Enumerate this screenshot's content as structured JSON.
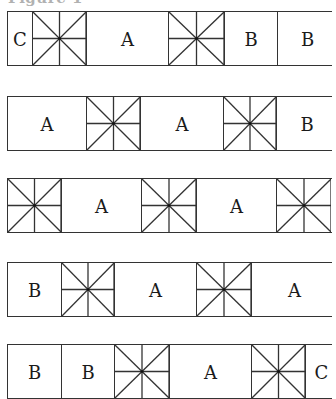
{
  "figure": {
    "title": "Figure 1",
    "rows": [
      {
        "top": 11,
        "cells": [
          {
            "type": "letter",
            "label": "C",
            "x": 0,
            "w": 25
          },
          {
            "type": "star",
            "label": "",
            "x": 25,
            "w": 54
          },
          {
            "type": "letter",
            "label": "A",
            "x": 79,
            "w": 82
          },
          {
            "type": "star",
            "label": "",
            "x": 161,
            "w": 56
          },
          {
            "type": "letter",
            "label": "B",
            "x": 217,
            "w": 53
          },
          {
            "type": "letter",
            "label": "B",
            "x": 270,
            "w": 60
          }
        ]
      },
      {
        "top": 96,
        "cells": [
          {
            "type": "letter",
            "label": "A",
            "x": 0,
            "w": 79
          },
          {
            "type": "star",
            "label": "",
            "x": 79,
            "w": 54
          },
          {
            "type": "letter",
            "label": "A",
            "x": 133,
            "w": 83
          },
          {
            "type": "star",
            "label": "",
            "x": 216,
            "w": 53
          },
          {
            "type": "letter",
            "label": "B",
            "x": 269,
            "w": 61
          }
        ]
      },
      {
        "top": 178,
        "cells": [
          {
            "type": "star",
            "label": "",
            "x": 0,
            "w": 54
          },
          {
            "type": "letter",
            "label": "A",
            "x": 54,
            "w": 80
          },
          {
            "type": "star",
            "label": "",
            "x": 134,
            "w": 55
          },
          {
            "type": "letter",
            "label": "A",
            "x": 189,
            "w": 80
          },
          {
            "type": "star",
            "label": "",
            "x": 269,
            "w": 55
          }
        ]
      },
      {
        "top": 262,
        "cells": [
          {
            "type": "letter",
            "label": "B",
            "x": 0,
            "w": 54
          },
          {
            "type": "star",
            "label": "",
            "x": 54,
            "w": 53
          },
          {
            "type": "letter",
            "label": "A",
            "x": 107,
            "w": 82
          },
          {
            "type": "star",
            "label": "",
            "x": 189,
            "w": 55
          },
          {
            "type": "letter",
            "label": "A",
            "x": 244,
            "w": 86
          }
        ]
      },
      {
        "top": 344,
        "cells": [
          {
            "type": "letter",
            "label": "B",
            "x": 0,
            "w": 54
          },
          {
            "type": "letter",
            "label": "B",
            "x": 54,
            "w": 53
          },
          {
            "type": "star",
            "label": "",
            "x": 107,
            "w": 55
          },
          {
            "type": "letter",
            "label": "A",
            "x": 162,
            "w": 82
          },
          {
            "type": "star",
            "label": "",
            "x": 244,
            "w": 54
          },
          {
            "type": "letter",
            "label": "C",
            "x": 298,
            "w": 32
          }
        ]
      }
    ]
  }
}
